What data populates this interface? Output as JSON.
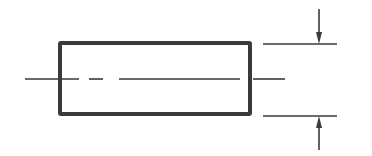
{
  "diagram": {
    "type": "technical-drawing",
    "background": "#ffffff",
    "ink_color": "#3a3a3a",
    "body": {
      "x": 60,
      "y": 43,
      "width": 190,
      "height": 71,
      "stroke_width": 4,
      "corner_radius": 1
    },
    "centerline": {
      "y": 79,
      "x_start": 25,
      "x_end": 285,
      "stroke_width": 1.6,
      "segments": [
        [
          25,
          79
        ],
        [
          89,
          103
        ],
        [
          119,
          240
        ],
        [
          253,
          285
        ]
      ],
      "gaps_pattern": "long-short-long (dash-dot style)"
    },
    "extension_lines": [
      {
        "name": "top",
        "x_start": 263,
        "x_end": 337,
        "y": 44
      },
      {
        "name": "bottom",
        "x_start": 263,
        "x_end": 337,
        "y": 116
      }
    ],
    "dimension_arrows": [
      {
        "name": "top-arrow",
        "x": 319,
        "tail_y": 9,
        "tip_y": 44,
        "direction": "down"
      },
      {
        "name": "bottom-arrow",
        "x": 319,
        "tail_y": 150,
        "tip_y": 116,
        "direction": "up"
      }
    ],
    "labels": []
  }
}
